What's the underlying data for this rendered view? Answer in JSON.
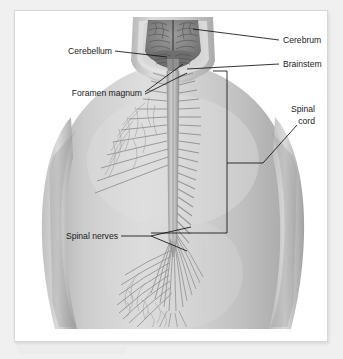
{
  "figure": {
    "background_color": "#f0f0f0",
    "panel_color": "#ffffff",
    "panel_border_color": "#d8d8d8",
    "leader_color": "#111111",
    "text_color": "#1b1b1b",
    "skin_tone": "#c9c9c9",
    "skin_shadow": "#9a9a9a",
    "skin_highlight": "#e2e2e2",
    "brain_tone": "#8d8d8d",
    "brain_shadow": "#6a6a6a",
    "cord_tone": "#b4b4b4",
    "nerve_tone": "#8f8f8f"
  },
  "labels": [
    {
      "id": "cerebrum",
      "text": "Cerebrum",
      "align": "left",
      "x": 268,
      "y": 32,
      "lines": [
        "Cerebrum"
      ]
    },
    {
      "id": "brainstem",
      "text": "Brainstem",
      "align": "left",
      "x": 268,
      "y": 56,
      "lines": [
        "Brainstem"
      ]
    },
    {
      "id": "spinal-cord",
      "text": "Spinal cord",
      "align": "right",
      "x": 332,
      "y": 106,
      "lines": [
        "Spinal",
        "cord"
      ]
    },
    {
      "id": "cerebellum",
      "text": "Cerebellum",
      "align": "right",
      "x": 97,
      "y": 43,
      "lines": [
        "Cerebellum"
      ]
    },
    {
      "id": "foramen-magnum",
      "text": "Foramen magnum",
      "align": "right",
      "x": 127,
      "y": 85,
      "lines": [
        "Foramen magnum"
      ]
    },
    {
      "id": "spinal-nerves",
      "text": "Spinal nerves",
      "align": "right",
      "x": 103,
      "y": 228,
      "lines": [
        "Spinal nerves"
      ]
    }
  ],
  "anatomy": {
    "structures": [
      "cerebrum",
      "cerebellum",
      "brainstem",
      "foramen magnum",
      "spinal cord",
      "spinal nerves",
      "cauda equina"
    ]
  }
}
